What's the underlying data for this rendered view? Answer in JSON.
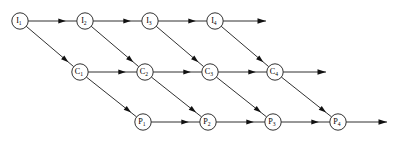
{
  "diagram": {
    "type": "directed-lattice",
    "canvas": {
      "width": 402,
      "height": 146,
      "background": "#ffffff"
    },
    "style": {
      "node_fill": "#ffffff",
      "node_stroke": "#1a1a1a",
      "node_radius": 8.2,
      "edge_color": "#1a1a1a",
      "arrow_color": "#111111",
      "label_color": "#000000"
    },
    "rows": [
      {
        "id": "row-i",
        "prefix": "I",
        "y": 21,
        "x_start": 20,
        "x_step": 65
      },
      {
        "id": "row-c",
        "prefix": "C",
        "y": 72,
        "x_start": 80,
        "x_step": 65
      },
      {
        "id": "row-p",
        "prefix": "P",
        "y": 122,
        "x_start": 143,
        "x_step": 65
      }
    ],
    "nodes": [
      {
        "id": "I1",
        "base": "I",
        "sub": "1",
        "x": 20,
        "y": 21,
        "row": "row-i"
      },
      {
        "id": "I2",
        "base": "I",
        "sub": "2",
        "x": 85,
        "y": 21,
        "row": "row-i"
      },
      {
        "id": "I3",
        "base": "I",
        "sub": "3",
        "x": 150,
        "y": 21,
        "row": "row-i"
      },
      {
        "id": "I4",
        "base": "I",
        "sub": "4",
        "x": 215,
        "y": 21,
        "row": "row-i"
      },
      {
        "id": "C1",
        "base": "C",
        "sub": "1",
        "x": 80,
        "y": 72,
        "row": "row-c"
      },
      {
        "id": "C2",
        "base": "C",
        "sub": "2",
        "x": 145,
        "y": 72,
        "row": "row-c"
      },
      {
        "id": "C3",
        "base": "C",
        "sub": "3",
        "x": 210,
        "y": 72,
        "row": "row-c"
      },
      {
        "id": "C4",
        "base": "C",
        "sub": "4",
        "x": 275,
        "y": 72,
        "row": "row-c"
      },
      {
        "id": "P1",
        "base": "P",
        "sub": "1",
        "x": 143,
        "y": 122,
        "row": "row-p"
      },
      {
        "id": "P2",
        "base": "P",
        "sub": "2",
        "x": 208,
        "y": 122,
        "row": "row-p"
      },
      {
        "id": "P3",
        "base": "P",
        "sub": "3",
        "x": 273,
        "y": 122,
        "row": "row-p"
      },
      {
        "id": "P4",
        "base": "P",
        "sub": "4",
        "x": 338,
        "y": 122,
        "row": "row-p"
      }
    ],
    "edges": [
      {
        "id": "e-I1-I2",
        "from": "I1",
        "to": "I2",
        "kind": "horizontal"
      },
      {
        "id": "e-I2-I3",
        "from": "I2",
        "to": "I3",
        "kind": "horizontal"
      },
      {
        "id": "e-I3-I4",
        "from": "I3",
        "to": "I4",
        "kind": "horizontal"
      },
      {
        "id": "e-C1-C2",
        "from": "C1",
        "to": "C2",
        "kind": "horizontal"
      },
      {
        "id": "e-C2-C3",
        "from": "C2",
        "to": "C3",
        "kind": "horizontal"
      },
      {
        "id": "e-C3-C4",
        "from": "C3",
        "to": "C4",
        "kind": "horizontal"
      },
      {
        "id": "e-P1-P2",
        "from": "P1",
        "to": "P2",
        "kind": "horizontal"
      },
      {
        "id": "e-P2-P3",
        "from": "P2",
        "to": "P3",
        "kind": "horizontal"
      },
      {
        "id": "e-P3-P4",
        "from": "P3",
        "to": "P4",
        "kind": "horizontal"
      },
      {
        "id": "e-I1-C1",
        "from": "I1",
        "to": "C1",
        "kind": "diagonal"
      },
      {
        "id": "e-I2-C2",
        "from": "I2",
        "to": "C2",
        "kind": "diagonal"
      },
      {
        "id": "e-I3-C3",
        "from": "I3",
        "to": "C3",
        "kind": "diagonal"
      },
      {
        "id": "e-I4-C4",
        "from": "I4",
        "to": "C4",
        "kind": "diagonal"
      },
      {
        "id": "e-C1-P1",
        "from": "C1",
        "to": "P1",
        "kind": "diagonal"
      },
      {
        "id": "e-C2-P2",
        "from": "C2",
        "to": "P2",
        "kind": "diagonal"
      },
      {
        "id": "e-C3-P3",
        "from": "C3",
        "to": "P3",
        "kind": "diagonal"
      },
      {
        "id": "e-C4-P4",
        "from": "C4",
        "to": "P4",
        "kind": "diagonal"
      }
    ],
    "terminal_edges": [
      {
        "id": "t-I4",
        "from": "I4",
        "y": 21,
        "x_end": 266,
        "row": "row-i"
      },
      {
        "id": "t-C4",
        "from": "C4",
        "y": 72,
        "x_end": 326,
        "row": "row-c"
      },
      {
        "id": "t-P4",
        "from": "P4",
        "y": 122,
        "x_end": 387,
        "row": "row-p"
      }
    ]
  }
}
